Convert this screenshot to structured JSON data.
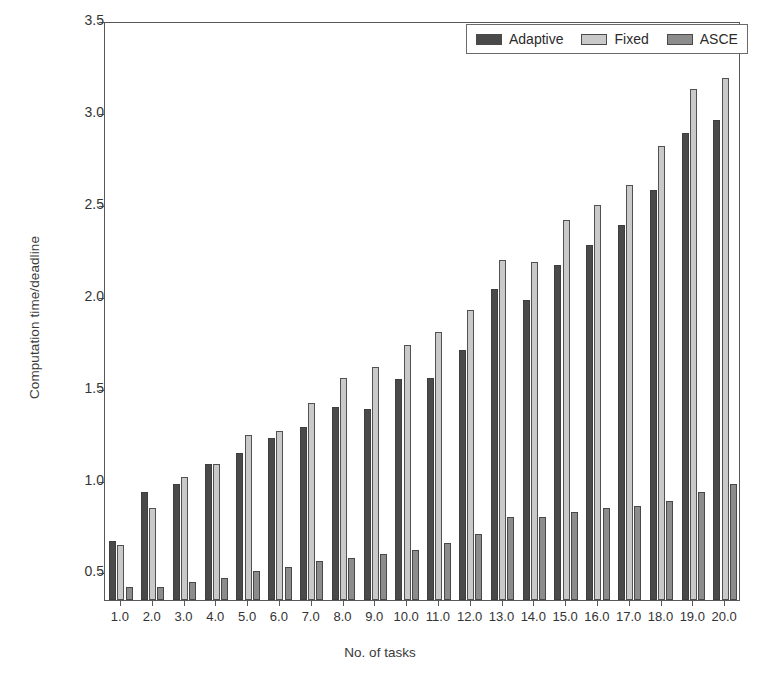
{
  "chart_data": {
    "type": "bar",
    "title": "",
    "subtitle": "",
    "xlabel": "No. of tasks",
    "ylabel": "Computation time/deadline",
    "categories": [
      "1.0",
      "2.0",
      "3.0",
      "4.0",
      "5.0",
      "6.0",
      "7.0",
      "8.0",
      "9.0",
      "10.0",
      "11.0",
      "12.0",
      "13.0",
      "14.0",
      "15.0",
      "16.0",
      "17.0",
      "18.0",
      "19.0",
      "20.0"
    ],
    "series": [
      {
        "name": "Adaptive",
        "color": "#4a4a4a",
        "values": [
          0.67,
          0.94,
          0.98,
          1.09,
          1.15,
          1.23,
          1.29,
          1.4,
          1.39,
          1.55,
          1.56,
          1.71,
          2.04,
          1.98,
          2.17,
          2.28,
          2.39,
          2.58,
          2.89,
          2.96
        ]
      },
      {
        "name": "Fixed",
        "color": "#c9c9c9",
        "values": [
          0.65,
          0.85,
          1.02,
          1.09,
          1.25,
          1.27,
          1.42,
          1.56,
          1.62,
          1.74,
          1.81,
          1.93,
          2.2,
          2.19,
          2.42,
          2.5,
          2.61,
          2.82,
          3.13,
          3.19
        ]
      },
      {
        "name": "ASCE",
        "color": "#8c8c8c",
        "values": [
          0.42,
          0.42,
          0.45,
          0.47,
          0.51,
          0.53,
          0.56,
          0.58,
          0.6,
          0.62,
          0.66,
          0.71,
          0.8,
          0.8,
          0.83,
          0.85,
          0.86,
          0.89,
          0.94,
          0.98
        ]
      }
    ],
    "yticks": [
      "0.5",
      "1.0",
      "1.5",
      "2.0",
      "2.5",
      "3.0",
      "3.5"
    ],
    "ytick_values": [
      0.5,
      1.0,
      1.5,
      2.0,
      2.5,
      3.0,
      3.5
    ],
    "ylim": [
      0.35,
      3.5
    ],
    "grid": false,
    "legend_position": "top-right",
    "legend_entries": [
      "Adaptive",
      "Fixed",
      "ASCE"
    ]
  },
  "axis": {
    "y_title": "Computation time/deadline",
    "x_title": "No. of tasks"
  }
}
